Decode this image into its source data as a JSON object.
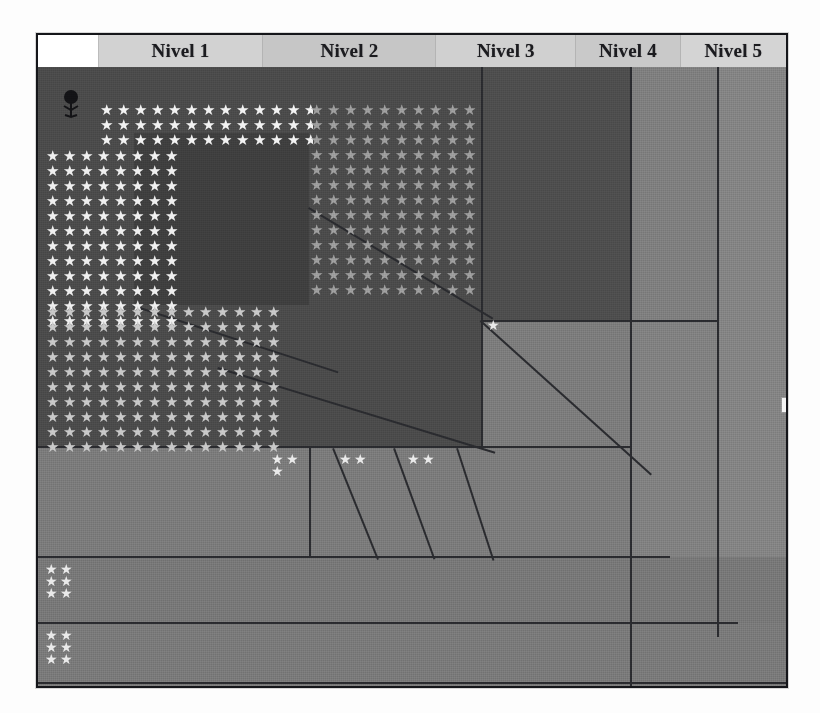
{
  "window": {
    "title": "Nivel viewer"
  },
  "tabs": [
    {
      "id": "blank",
      "label": "",
      "width": 60,
      "state": "active-blank"
    },
    {
      "id": "nivel1",
      "label": "Nivel 1",
      "width": 165,
      "state": "normal"
    },
    {
      "id": "nivel2",
      "label": "Nivel 2",
      "width": 173,
      "state": "normal"
    },
    {
      "id": "nivel3",
      "label": "Nivel 3",
      "width": 140,
      "state": "normal"
    },
    {
      "id": "nivel4",
      "label": "Nivel 4",
      "width": 104,
      "state": "normal"
    },
    {
      "id": "nivel5",
      "label": "Nivel 5",
      "width": 106,
      "state": "clipped"
    }
  ],
  "icons": {
    "tree": "tree-icon",
    "cursor": "scroll-thumb"
  },
  "scene": {
    "description": "Perspective room grid with star-marker fields",
    "star_glyph": "★",
    "starfields": [
      {
        "id": "top-left-bright",
        "rows": 3,
        "cols": 13,
        "tone": "bright"
      },
      {
        "id": "left-bright",
        "rows": 12,
        "cols": 8,
        "tone": "bright"
      },
      {
        "id": "left-dim",
        "rows": 10,
        "cols": 14,
        "tone": "dim"
      },
      {
        "id": "top-mid-dim",
        "rows": 13,
        "cols": 10,
        "tone": "dim"
      }
    ],
    "clusters": [
      {
        "id": "floor-cell-1",
        "count": 3
      },
      {
        "id": "floor-cell-2",
        "count": 2
      },
      {
        "id": "floor-cell-3",
        "count": 2
      },
      {
        "id": "mid-right-single",
        "count": 1
      },
      {
        "id": "bottom-left-a",
        "count": 6
      },
      {
        "id": "bottom-left-b",
        "count": 6
      }
    ]
  },
  "colors": {
    "frame_border": "#15161a",
    "tab_active": "#ffffff",
    "tab_normal": "#cfcfcf",
    "wall_dark": "#3f3f3f",
    "wall_mid": "#4b4b4b",
    "floor_light": "#7b7b7b",
    "grid_line": "#2a2b2f",
    "star_bright": "#f2f2f2",
    "star_dim": "#9e9e9e"
  }
}
